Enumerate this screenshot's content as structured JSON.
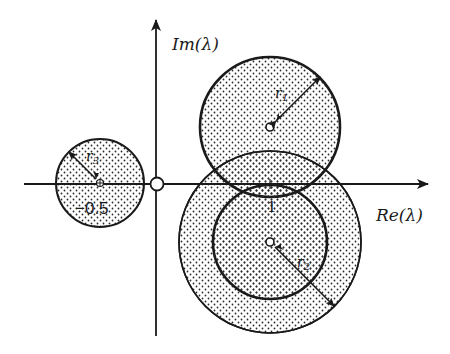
{
  "diagram": {
    "axes": {
      "x_label": "Re(λ)",
      "y_label": "Im(λ)"
    },
    "origin_marker": "open-circle",
    "disks": [
      {
        "id": "disk-1",
        "center_label": "",
        "radius_label": "r",
        "radius_subscript": "1",
        "style": "thick-outline-dotted"
      },
      {
        "id": "disk-2-inner",
        "center_label": "",
        "radius_label": "r",
        "radius_subscript": "2",
        "style": "thick-outline-dotted"
      },
      {
        "id": "disk-2-outer",
        "center_label": "",
        "radius_label": "",
        "radius_subscript": "",
        "style": "thin-outline-dotted"
      },
      {
        "id": "disk-3",
        "center_label": "-0.5",
        "radius_label": "r",
        "radius_subscript": "3",
        "style": "thin-outline-dotted"
      }
    ],
    "tick_labels": {
      "one": "1",
      "minus_half": "−0.5"
    }
  },
  "colors": {
    "ink": "#1a1a1a",
    "background": "#ffffff",
    "dot": "#2b2b2b"
  }
}
